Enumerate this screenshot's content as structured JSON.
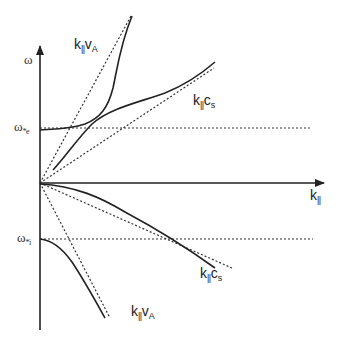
{
  "diagram": {
    "type": "dispersion-relation",
    "axes": {
      "y_label": "ω",
      "x_label_main": "k",
      "x_label_sub": "||"
    },
    "levels": {
      "omega_star_e": {
        "main": "ω",
        "sub": "*e"
      },
      "omega_star_i": {
        "main": "ω",
        "sub": "*i"
      }
    },
    "asymptote_labels": {
      "upper_alfven": {
        "main": "k",
        "sub": "||",
        "rest": "v",
        "rest_sub": "A"
      },
      "upper_sound": {
        "main": "k",
        "sub": "||",
        "rest": "c",
        "rest_sub": "s"
      },
      "lower_sound": {
        "main": "k",
        "sub": "||",
        "rest": "c",
        "rest_sub": "s"
      },
      "lower_alfven": {
        "main": "k",
        "sub": "||",
        "rest": "v",
        "rest_sub": "A"
      }
    },
    "colors": {
      "line": "#222222",
      "dotted": "#333333",
      "background": "#ffffff"
    }
  }
}
